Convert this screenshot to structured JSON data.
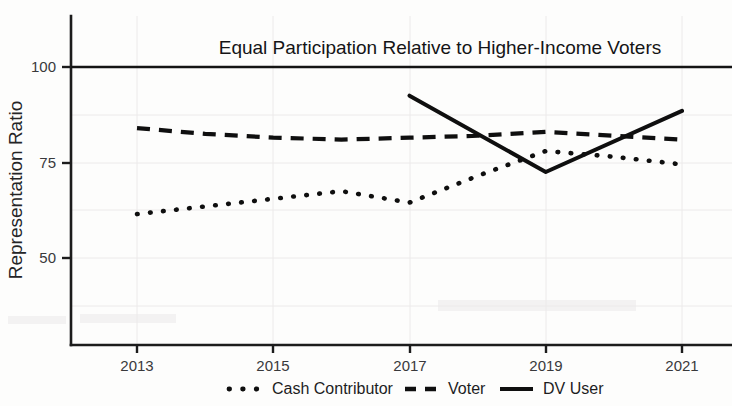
{
  "chart_data": {
    "type": "line",
    "title": "",
    "annotation": "Equal Participation Relative to Higher-Income Voters",
    "annotation_value": 100,
    "xlabel": "",
    "ylabel": "Representation Ratio",
    "x": [
      2013,
      2014,
      2015,
      2016,
      2017,
      2018,
      2019,
      2020,
      2021
    ],
    "xtick_labels": [
      "2013",
      "2015",
      "2017",
      "2019",
      "2021"
    ],
    "xticks": [
      2013,
      2015,
      2017,
      2019,
      2021
    ],
    "ytick_labels": [
      "100",
      "75",
      "50"
    ],
    "yticks": [
      100,
      75,
      50
    ],
    "xlim": [
      2012.3,
      2021.7
    ],
    "ylim": [
      20,
      108
    ],
    "grid": true,
    "legend_position": "bottom",
    "series": [
      {
        "name": "Cash Contributor",
        "style": "dotted",
        "color": "#0f0f0f",
        "x": [
          2013,
          2014,
          2015,
          2016,
          2017,
          2018,
          2019,
          2020,
          2021
        ],
        "values": [
          61.5,
          63.5,
          65.5,
          67.5,
          64.5,
          71.5,
          78.0,
          76.5,
          74.5
        ]
      },
      {
        "name": "Voter",
        "style": "dashed",
        "color": "#0f0f0f",
        "x": [
          2013,
          2014,
          2015,
          2016,
          2017,
          2018,
          2019,
          2020,
          2021
        ],
        "values": [
          84.0,
          82.5,
          81.5,
          81.0,
          81.5,
          82.0,
          83.0,
          82.0,
          81.0
        ]
      },
      {
        "name": "DV User",
        "style": "solid",
        "color": "#0f0f0f",
        "x": [
          2017,
          2019,
          2021
        ],
        "values": [
          92.5,
          72.5,
          88.5
        ]
      }
    ]
  },
  "legend": {
    "entries": [
      {
        "label": "Cash Contributor",
        "style": "dotted"
      },
      {
        "label": "Voter",
        "style": "dashed"
      },
      {
        "label": "DV User",
        "style": "solid"
      }
    ]
  },
  "axes": {
    "y_title": "Representation Ratio",
    "y_ticks": [
      "100",
      "75",
      "50"
    ],
    "x_ticks": [
      "2013",
      "2015",
      "2017",
      "2019",
      "2021"
    ]
  },
  "annotation": {
    "text": "Equal Participation Relative to Higher-Income Voters"
  }
}
